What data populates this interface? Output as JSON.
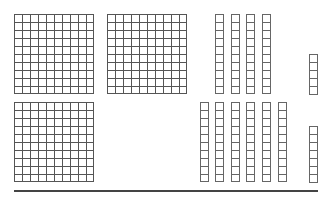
{
  "diagram": {
    "type": "base-ten-blocks",
    "background": "#ffffff",
    "line_color": "#555555",
    "rows": [
      {
        "name": "top-row",
        "hundreds": 2,
        "tens": 4,
        "ones": 5,
        "value": 245
      },
      {
        "name": "bottom-row",
        "hundreds": 1,
        "tens": 6,
        "ones": 7,
        "value": 167
      }
    ],
    "hundreds_positions": [
      {
        "x": 14,
        "y": 14
      },
      {
        "x": 107,
        "y": 14
      },
      {
        "x": 14,
        "y": 102
      }
    ],
    "tens_positions": [
      {
        "x": 215,
        "y": 14
      },
      {
        "x": 231,
        "y": 14
      },
      {
        "x": 246,
        "y": 14
      },
      {
        "x": 262,
        "y": 14
      },
      {
        "x": 200,
        "y": 102
      },
      {
        "x": 215,
        "y": 102
      },
      {
        "x": 231,
        "y": 102
      },
      {
        "x": 246,
        "y": 102
      },
      {
        "x": 262,
        "y": 102
      },
      {
        "x": 278,
        "y": 102
      }
    ],
    "ones_columns": [
      {
        "x": 309,
        "y": 54,
        "count": 5
      },
      {
        "x": 309,
        "y": 126,
        "count": 7
      }
    ],
    "baseline": {
      "x1": 14,
      "x2": 318,
      "y": 191
    }
  }
}
